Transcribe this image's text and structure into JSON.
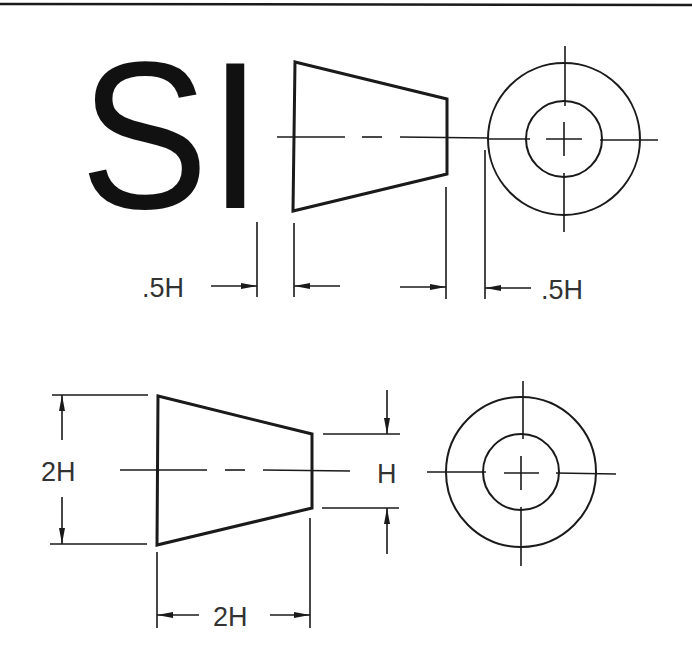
{
  "diagram": {
    "title_letters": "SI",
    "colors": {
      "line": "#1a1a1a",
      "text": "#333333",
      "background": "#ffffff"
    },
    "top_view": {
      "left_dim_label": ".5H",
      "right_dim_label": ".5H"
    },
    "bottom_view": {
      "height_label": "2H",
      "small_height_label": "H",
      "width_label": "2H"
    }
  }
}
